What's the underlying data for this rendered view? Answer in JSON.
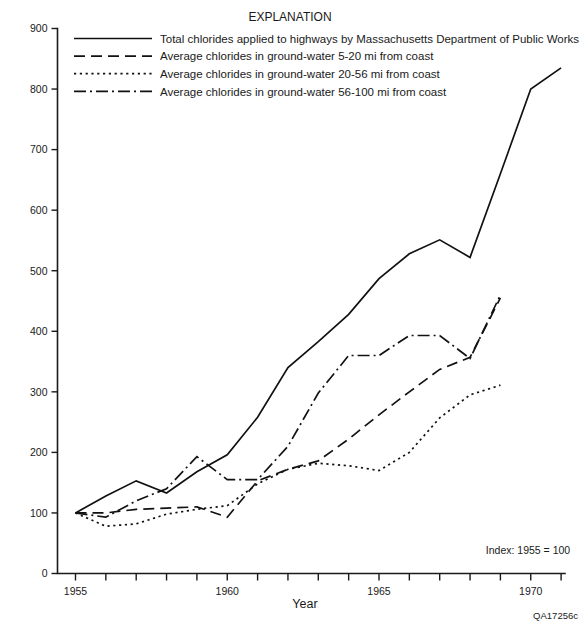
{
  "figure": {
    "id_label": "QA17256c",
    "note": "Index: 1955 = 100",
    "legend_title": "EXPLANATION"
  },
  "chart_data": {
    "type": "line",
    "title": "",
    "subtitle": "",
    "xlabel": "Year",
    "ylabel": "",
    "xlim": [
      1954.2,
      1971.6
    ],
    "ylim": [
      0,
      900
    ],
    "xticks": [
      1955,
      1956,
      1957,
      1958,
      1959,
      1960,
      1961,
      1962,
      1963,
      1964,
      1965,
      1966,
      1967,
      1968,
      1969,
      1970,
      1971
    ],
    "xtick_labels_shown": [
      1955,
      1960,
      1965,
      1970
    ],
    "yticks": [
      0,
      100,
      200,
      300,
      400,
      500,
      600,
      700,
      800,
      900
    ],
    "grid": false,
    "legend_position": "top-center",
    "annotations": [
      "Index: 1955 = 100",
      "QA17256c"
    ],
    "series": [
      {
        "name": "Total chlorides applied to highways by Massachusetts Department of Public Works",
        "dash": "solid",
        "dasharray": "none",
        "x": [
          1955,
          1956,
          1957,
          1958,
          1959,
          1960,
          1961,
          1962,
          1963,
          1964,
          1965,
          1966,
          1967,
          1968,
          1969,
          1970,
          1971
        ],
        "values": [
          100,
          128,
          153,
          133,
          168,
          196,
          258,
          340,
          383,
          428,
          487,
          528,
          551,
          522,
          660,
          800,
          835
        ]
      },
      {
        "name": "Average chlorides in ground-water 5-20 mi from coast",
        "dash": "dashed",
        "dasharray": "11,6",
        "x": [
          1955,
          1956,
          1957,
          1958,
          1959,
          1960,
          1961,
          1962,
          1963,
          1964,
          1965,
          1966,
          1967,
          1968,
          1969
        ],
        "values": [
          100,
          100,
          106,
          108,
          110,
          93,
          153,
          172,
          186,
          222,
          262,
          300,
          337,
          357,
          455
        ]
      },
      {
        "name": "Average chlorides in ground-water 20-56 mi from coast",
        "dash": "dotted",
        "dasharray": "2.2,3.6",
        "x": [
          1955,
          1956,
          1957,
          1958,
          1959,
          1960,
          1961,
          1962,
          1963,
          1964,
          1965,
          1966,
          1967,
          1968,
          1969
        ],
        "values": [
          100,
          78,
          82,
          98,
          106,
          112,
          148,
          172,
          182,
          178,
          170,
          200,
          257,
          295,
          311
        ]
      },
      {
        "name": "Average chlorides in ground-water 56-100 mi from coast",
        "dash": "dashdot",
        "dasharray": "12,4,2,4",
        "x": [
          1955,
          1956,
          1957,
          1958,
          1959,
          1960,
          1961,
          1962,
          1963,
          1964,
          1965,
          1966,
          1967,
          1968,
          1969
        ],
        "values": [
          100,
          93,
          120,
          140,
          193,
          155,
          155,
          210,
          298,
          360,
          360,
          393,
          393,
          355,
          460
        ]
      }
    ]
  }
}
